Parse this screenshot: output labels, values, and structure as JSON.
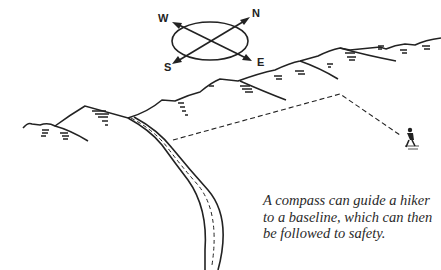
{
  "illustration": {
    "subject": "compass navigation to a baseline",
    "compass": {
      "labels": {
        "north": "N",
        "south": "S",
        "east": "E",
        "west": "W"
      }
    },
    "elements": [
      "compass",
      "mountain-ridge",
      "road",
      "dashed-route",
      "hiker"
    ]
  },
  "caption": {
    "text": "A compass can guide a hiker to a baseline, which can then be followed to safety."
  },
  "colors": {
    "ink": "#222222",
    "background": "#ffffff"
  }
}
